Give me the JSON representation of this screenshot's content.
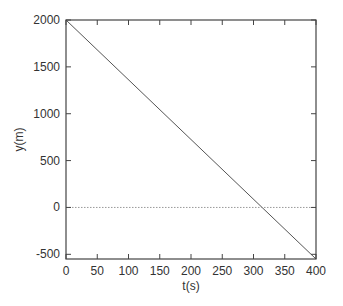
{
  "chart_data": {
    "type": "line",
    "title": "",
    "xlabel": "t(s)",
    "ylabel": "y(m)",
    "xlim": [
      0,
      400
    ],
    "ylim": [
      -550,
      2000
    ],
    "xticks": [
      0,
      50,
      100,
      150,
      200,
      250,
      300,
      350,
      400
    ],
    "yticks": [
      -500,
      0,
      500,
      1000,
      1500,
      2000
    ],
    "grid": false,
    "legend": null,
    "series": [
      {
        "name": "y(t)",
        "style": "solid",
        "color": "#555555",
        "x": [
          0,
          400
        ],
        "y": [
          2000,
          -550
        ]
      },
      {
        "name": "y = 0",
        "style": "dotted",
        "color": "#888888",
        "x": [
          0,
          400
        ],
        "y": [
          0,
          0
        ]
      }
    ],
    "annotations": []
  },
  "colors": {
    "axis": "#444444",
    "line": "#555555",
    "zero_line": "#999999",
    "text": "#333333"
  }
}
